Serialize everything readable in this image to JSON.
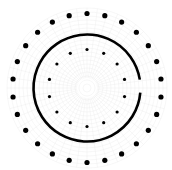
{
  "diagram": {
    "type": "concentric-dot-rings",
    "canvas": {
      "width": 172,
      "height": 170,
      "background": "#ffffff"
    },
    "center": {
      "x": 87,
      "y": 88
    },
    "background_texture": {
      "color": "#ececec",
      "outer_radius": 80,
      "concentric_step": 4,
      "radial_spokes": 48
    },
    "outer_dot_ring": {
      "count": 26,
      "radius": 74.5,
      "dot_radius": 2.6,
      "start_angle_deg": -90,
      "color": "#000000"
    },
    "solid_ring": {
      "radius": 53.5,
      "stroke_width": 2.6,
      "color": "#000000",
      "gap_start_deg": -9,
      "gap_end_deg": 5
    },
    "inner_dot_ring": {
      "count": 14,
      "radius": 38.5,
      "dot_radius": 1.6,
      "start_angle_deg": -90,
      "color": "#000000"
    }
  }
}
